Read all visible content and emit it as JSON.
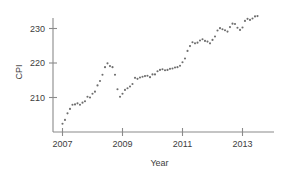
{
  "chart_data": {
    "type": "scatter",
    "title": "",
    "xlabel": "Year",
    "ylabel": "CPI",
    "xlim": [
      2006.9,
      2013.7
    ],
    "ylim": [
      200.5,
      234.5
    ],
    "grid": false,
    "legend": null,
    "marker": {
      "shape": "circle",
      "size_px": 2.1,
      "color": "#6e6e6e"
    },
    "axis_color": "#8a8a8a",
    "text_color": "#3d3d3d",
    "xticks": [
      2007,
      2009,
      2011,
      2013
    ],
    "xtick_labels": [
      "2007",
      "2009",
      "2011",
      "2013"
    ],
    "yticks": [
      210,
      220,
      230
    ],
    "ytick_labels": [
      "210",
      "220",
      "230"
    ],
    "series": [
      {
        "name": "CPI",
        "x": [
          2007.0,
          2007.083,
          2007.167,
          2007.25,
          2007.333,
          2007.417,
          2007.5,
          2007.583,
          2007.667,
          2007.75,
          2007.833,
          2007.917,
          2008.0,
          2008.083,
          2008.167,
          2008.25,
          2008.333,
          2008.417,
          2008.5,
          2008.583,
          2008.667,
          2008.75,
          2008.833,
          2008.917,
          2009.0,
          2009.083,
          2009.167,
          2009.25,
          2009.333,
          2009.417,
          2009.5,
          2009.583,
          2009.667,
          2009.75,
          2009.833,
          2009.917,
          2010.0,
          2010.083,
          2010.167,
          2010.25,
          2010.333,
          2010.417,
          2010.5,
          2010.583,
          2010.667,
          2010.75,
          2010.833,
          2010.917,
          2011.0,
          2011.083,
          2011.167,
          2011.25,
          2011.333,
          2011.417,
          2011.5,
          2011.583,
          2011.667,
          2011.75,
          2011.833,
          2011.917,
          2012.0,
          2012.083,
          2012.167,
          2012.25,
          2012.333,
          2012.417,
          2012.5,
          2012.583,
          2012.667,
          2012.75,
          2012.833,
          2012.917,
          2013.0,
          2013.083,
          2013.167,
          2013.25,
          2013.333,
          2013.417,
          2013.5
        ],
        "y": [
          202.4,
          203.5,
          205.4,
          206.7,
          207.9,
          208.0,
          208.3,
          207.9,
          208.5,
          208.9,
          210.2,
          210.0,
          211.1,
          211.7,
          213.5,
          214.8,
          216.6,
          218.8,
          219.9,
          219.1,
          218.8,
          216.6,
          212.4,
          210.2,
          211.1,
          212.2,
          212.7,
          213.2,
          213.9,
          215.7,
          215.4,
          215.8,
          216.0,
          216.2,
          216.3,
          215.9,
          216.7,
          216.7,
          217.6,
          218.0,
          218.2,
          217.9,
          218.0,
          218.3,
          218.4,
          218.7,
          218.8,
          219.2,
          220.2,
          221.3,
          223.5,
          224.9,
          226.0,
          225.7,
          225.9,
          226.5,
          226.9,
          226.4,
          226.2,
          225.7,
          226.7,
          227.7,
          229.4,
          230.1,
          229.8,
          229.5,
          229.1,
          230.4,
          231.4,
          231.3,
          230.2,
          229.6,
          230.3,
          232.2,
          232.8,
          232.5,
          232.9,
          233.5,
          233.6
        ]
      }
    ]
  },
  "axes": {
    "y_label": "CPI",
    "x_label": "Year"
  }
}
